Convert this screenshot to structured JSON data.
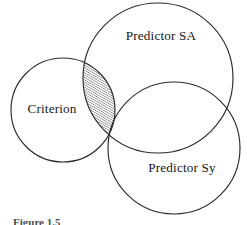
{
  "figure": {
    "type": "venn-diagram",
    "width": 247,
    "height": 225,
    "background_color": "#ffffff",
    "stroke_color": "#2b2b2b",
    "hatch_color": "#2b2b2b",
    "caption": "Figure 1.5"
  },
  "labels": {
    "criterion": "Criterion",
    "predictor_sa": "Predictor SA",
    "predictor_sy": "Predictor Sy"
  },
  "sets": [
    {
      "id": "criterion",
      "label": "Criterion",
      "cx": 63,
      "cy": 110,
      "r": 52,
      "label_x": 52,
      "label_y": 113
    },
    {
      "id": "predictor-sa",
      "label": "Predictor SA",
      "cx": 158,
      "cy": 78,
      "r": 75,
      "label_x": 161,
      "label_y": 40
    },
    {
      "id": "predictor-sy",
      "label": "Predictor Sy",
      "cx": 174,
      "cy": 148,
      "r": 66,
      "label_x": 182,
      "label_y": 172
    }
  ],
  "shaded_region": {
    "description": "Portion of Criterion overlapping Predictor SA or Predictor Sy",
    "fill_pattern": "diagonal-hatch",
    "hatch_angle_deg": 60,
    "hatch_spacing_px": 2.1,
    "hatch_line_width_px": 0.75
  }
}
